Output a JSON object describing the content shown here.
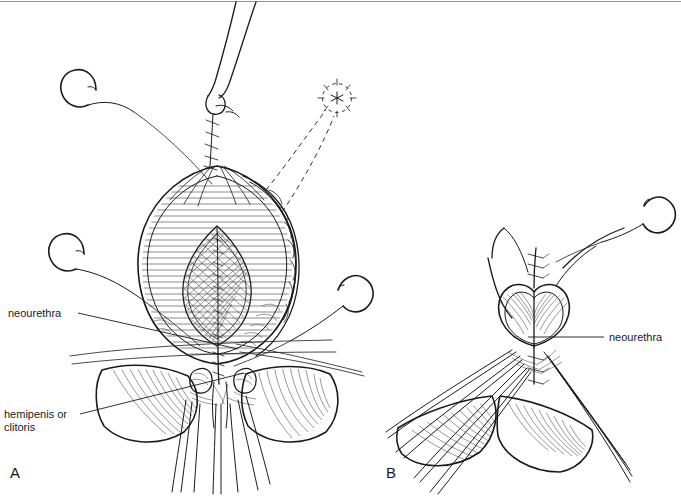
{
  "figure": {
    "background_color": "#ffffff",
    "ink_color": "#1a1a1a",
    "width": 681,
    "height": 496
  },
  "panels": [
    {
      "id": "A",
      "label": "A",
      "label_x": 10,
      "label_y": 478,
      "description": "Open view: everted tissue flap with hatched oval, cross-hatched lens-shaped neourethral plate, curved suture needles and traction sutures."
    },
    {
      "id": "B",
      "label": "B",
      "label_x": 386,
      "label_y": 478,
      "description": "Closed view: completed midline closure with heart-shaped introitus, suture marks above and below, traction sutures retracting labial folds."
    }
  ],
  "labels": [
    {
      "id": "neourethra-left",
      "text": "neourethra",
      "x": 8,
      "y": 317,
      "panel": "A",
      "leader": {
        "x1": 78,
        "y1": 313,
        "x2": 238,
        "y2": 349
      }
    },
    {
      "id": "hemipenis-or-clitoris",
      "text_line1": "hemipenis or",
      "text_line2": "clitoris",
      "x": 4,
      "y": 418,
      "panel": "A",
      "leader": {
        "x1": 80,
        "y1": 414,
        "x2": 244,
        "y2": 373
      }
    },
    {
      "id": "neourethra-right",
      "text": "neourethra",
      "x": 609,
      "y": 341,
      "panel": "B",
      "leader": {
        "x1": 604,
        "y1": 337,
        "x2": 528,
        "y2": 337
      }
    }
  ],
  "annotations": [
    {
      "id": "stoma-marker",
      "type": "dashed-circle-with-radiating-ticks",
      "cx": 337,
      "cy": 98,
      "r": 15,
      "panel": "A",
      "note": "dashed circular stoma site marking with asterisk center and radiating tick marks"
    },
    {
      "id": "dashed-projection-lines",
      "type": "dashed-leader-pair",
      "panel": "A",
      "note": "two dashed lines projecting from tissue toward the stoma marker"
    }
  ],
  "instruments": [
    {
      "id": "needle-upper-left",
      "type": "curved-suture-needle",
      "panel": "A",
      "x": 66,
      "y": 82
    },
    {
      "id": "needle-mid-left",
      "type": "curved-suture-needle",
      "panel": "A",
      "x": 52,
      "y": 247
    },
    {
      "id": "needle-right",
      "type": "curved-suture-needle",
      "panel": "A",
      "x": 352,
      "y": 295
    },
    {
      "id": "needle-upper-right",
      "type": "curved-suture-needle",
      "panel": "B",
      "x": 640,
      "y": 214
    }
  ]
}
